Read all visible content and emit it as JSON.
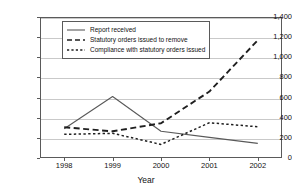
{
  "chart_data": {
    "type": "line",
    "title": "",
    "xlabel": "Year",
    "ylabel": "",
    "categories": [
      "1998",
      "1999",
      "2000",
      "2001",
      "2002"
    ],
    "x": [
      1998,
      1999,
      2000,
      2001,
      2002
    ],
    "ylim": [
      0,
      1400
    ],
    "yticks": [
      0,
      200,
      400,
      600,
      800,
      1000,
      1200,
      1400
    ],
    "ytick_labels": [
      "0",
      "200",
      "400",
      "600",
      "800",
      "1,000",
      "1,200",
      "1,400"
    ],
    "grid": true,
    "legend_position": "top-left-inside",
    "series": [
      {
        "name": "Report received",
        "style": "solid",
        "color": "#595959",
        "values": [
          290,
          610,
          265,
          205,
          145
        ]
      },
      {
        "name": "Statutory orders issued to remove",
        "style": "long-dash",
        "color": "#1f1f1f",
        "values": [
          305,
          265,
          345,
          660,
          1170
        ]
      },
      {
        "name": "Compliance with statutory orders issued",
        "style": "short-dash",
        "color": "#1f1f1f",
        "values": [
          235,
          245,
          135,
          350,
          310
        ]
      }
    ]
  },
  "legend": {
    "items": [
      {
        "label": "Report received"
      },
      {
        "label": "Statutory orders issued to remove"
      },
      {
        "label": "Compliance with statutory orders issued"
      }
    ]
  },
  "axis": {
    "x_title": "Year"
  }
}
